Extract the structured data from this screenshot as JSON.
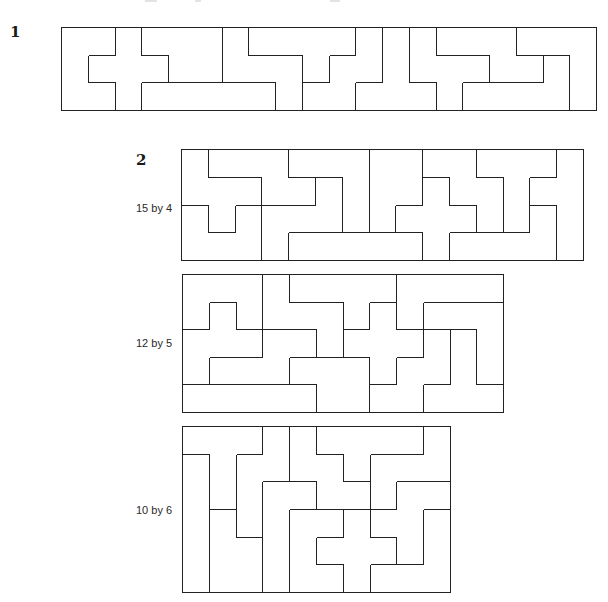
{
  "figures": [
    {
      "number": "1",
      "label": "",
      "cols": 20,
      "rows": 3,
      "grid": [
        "UUXPPPZYYYYWTFNNNVVV",
        "UXXXPPZZZYWWTFFFNNLV",
        "UUXIIIIIZWWTTTFLLLLV"
      ]
    },
    {
      "number": "2",
      "label": "15 by 4",
      "cols": 15,
      "rows": 4,
      "grid": [
        "FNNNVVVPPWWTTTY",
        "FFFNNZVPPXWWTYY",
        "UFUZZZVPXXXWTLY",
        "UUUZIIIIIXLLLLY"
      ]
    },
    {
      "number": "",
      "label": "12 by 5",
      "cols": 12,
      "rows": 5,
      "grid": [
        "UUUZYYYYLLLL",
        "UFUZZZYXLVVV",
        "FFFNNZXXXWTV",
        "FNNNPPPXWWTV",
        "IIIIIPPWWTTT"
      ]
    },
    {
      "number": "",
      "label": "10 by 6",
      "cols": 10,
      "rows": 6,
      "grid": [
        "TTTNWYYYYZ",
        "ITNNWWYZZZ",
        "ITNLLWWZFF",
        "IPNLUUXFFV",
        "IPPLUXXXFV",
        "IPPLUUXVVV"
      ]
    }
  ],
  "colors": {
    "stroke": "#222222",
    "background": "#ffffff"
  }
}
